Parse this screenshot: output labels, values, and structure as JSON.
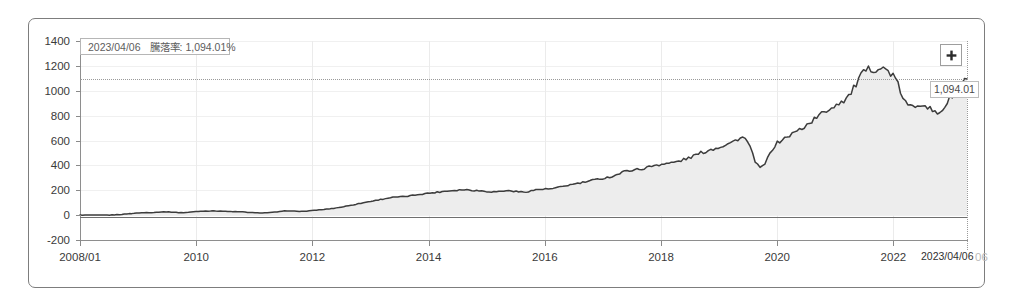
{
  "chart_data": {
    "type": "area",
    "title": "",
    "xlabel": "",
    "ylabel": "",
    "ylim": [
      -200,
      1400
    ],
    "yticks": [
      1400,
      1200,
      1000,
      800,
      600,
      400,
      200,
      0,
      -200
    ],
    "xticks": [
      "2008/01",
      "2010",
      "2012",
      "2014",
      "2016",
      "2018",
      "2020",
      "2022"
    ],
    "xlim": [
      "2008/01",
      "2023/04/06"
    ],
    "grid": true,
    "legend": "none",
    "series": [
      {
        "name": "cumulative-return",
        "unit": "%",
        "line_color": "#3c3c3c",
        "fill_color": "#ededed",
        "x": [
          "2008/01",
          "2008/07",
          "2009/01",
          "2009/07",
          "2009/10",
          "2010/01",
          "2010/04",
          "2010/07",
          "2010/10",
          "2011/01",
          "2011/04",
          "2011/07",
          "2011/10",
          "2012/01",
          "2012/04",
          "2012/07",
          "2012/10",
          "2013/01",
          "2013/04",
          "2013/07",
          "2013/10",
          "2014/01",
          "2014/04",
          "2014/07",
          "2014/10",
          "2015/01",
          "2015/04",
          "2015/07",
          "2015/10",
          "2016/01",
          "2016/04",
          "2016/07",
          "2016/10",
          "2017/01",
          "2017/04",
          "2017/07",
          "2017/10",
          "2018/01",
          "2018/04",
          "2018/07",
          "2018/10",
          "2019/01",
          "2019/04",
          "2019/07",
          "2019/10",
          "2020/01",
          "2020/03",
          "2020/06",
          "2020/09",
          "2020/12",
          "2021/03",
          "2021/06",
          "2021/09",
          "2021/12",
          "2022/01",
          "2022/03",
          "2022/06",
          "2022/09",
          "2022/12",
          "2023/02",
          "2023/04/06"
        ],
        "values": [
          0,
          0,
          0,
          8,
          18,
          22,
          26,
          20,
          30,
          34,
          30,
          26,
          18,
          22,
          34,
          30,
          40,
          52,
          72,
          96,
          118,
          140,
          150,
          168,
          182,
          196,
          204,
          196,
          188,
          196,
          186,
          206,
          214,
          240,
          262,
          288,
          312,
          356,
          372,
          404,
          420,
          452,
          500,
          540,
          580,
          612,
          382,
          560,
          640,
          712,
          800,
          880,
          960,
          1140,
          1180,
          1120,
          880,
          900,
          820,
          960,
          1094
        ]
      }
    ],
    "annotations": {
      "crosshair_value": 1094.01,
      "crosshair_date": "2023/04/06",
      "value_flag": "1,094.01",
      "date_flag": "2023/04/06"
    }
  },
  "tooltip": {
    "date": "2023/04/06",
    "metric_label": "騰落率",
    "separator": ":",
    "value": "1,094.01",
    "unit": "%"
  },
  "controls": {
    "expand_icon": "plus-icon",
    "expand_label": "+"
  },
  "axis": {
    "y_labels": [
      "1400",
      "1200",
      "1000",
      "800",
      "600",
      "400",
      "200",
      "0",
      "-200"
    ],
    "x_labels": [
      "2008/01",
      "2010",
      "2012",
      "2014",
      "2016",
      "2018",
      "2020",
      "2022"
    ],
    "x_end_label": "2023/06"
  }
}
